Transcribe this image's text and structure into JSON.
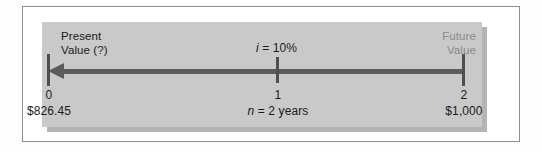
{
  "figure": {
    "type": "timeline-diagram",
    "topic": "present-value-of-a-single-amount",
    "panel_color": "#c9c9c9",
    "axis_color": "#5c5c5c",
    "frame_color": "#8e8e8e",
    "muted_text_color": "#8a8a8a"
  },
  "labels": {
    "present_value": "Present\nValue (?)",
    "present_value_line1": "Present",
    "present_value_line2": "Value (?)",
    "future_value_line1": "Future",
    "future_value_line2": "Value",
    "interest_rate_symbol": "i",
    "interest_rate_rest": " = 10%",
    "interest_rate_full": "i = 10%",
    "term_symbol": "n",
    "term_rest": " = 2 years",
    "term_full": "n = 2 years"
  },
  "timeline": {
    "direction": "right-to-left",
    "arrow_points_to": "period-0",
    "periods": [
      {
        "number": "0",
        "amount": "$826.45",
        "role": "present-value"
      },
      {
        "number": "1",
        "amount": "",
        "role": "intermediate"
      },
      {
        "number": "2",
        "amount": "$1,000",
        "role": "future-value"
      }
    ]
  },
  "chart_data": {
    "type": "line",
    "xlabel": "",
    "ylabel": "",
    "x": [
      0,
      1,
      2
    ],
    "tick_labels": [
      "0",
      "1",
      "2"
    ],
    "annotations": [
      {
        "text": "Present Value (?)",
        "at_x": 0,
        "position": "above-left"
      },
      {
        "text": "$826.45",
        "at_x": 0,
        "position": "below"
      },
      {
        "text": "i = 10%",
        "at_x": 1,
        "position": "above"
      },
      {
        "text": "n = 2 years",
        "at_x": 1,
        "position": "below"
      },
      {
        "text": "Future Value",
        "at_x": 2,
        "position": "above-right"
      },
      {
        "text": "$1,000",
        "at_x": 2,
        "position": "below"
      }
    ],
    "series": [
      {
        "name": "cash flow",
        "values": [
          826.45,
          null,
          1000
        ]
      }
    ],
    "interest_rate_percent": 10,
    "periods": 2,
    "grid": false,
    "legend": "none"
  }
}
